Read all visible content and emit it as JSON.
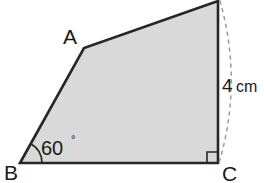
{
  "figure": {
    "kind": "geometry-diagram",
    "shape_name": "quadrilateral",
    "fill_color": "#d9d9d9",
    "stroke_color": "#262626",
    "stroke_width": 2.6,
    "dash_color": "#9a9a9a",
    "background": "#ffffff",
    "canvas": {
      "width": 264,
      "height": 183
    }
  },
  "vertices": {
    "A": {
      "label": "A",
      "x": 84,
      "y": 48,
      "label_x": 70,
      "label_y": 44
    },
    "B": {
      "label": "B",
      "x": 20,
      "y": 163,
      "label_x": 4,
      "label_y": 180
    },
    "C": {
      "label": "C",
      "x": 218,
      "y": 163,
      "label_x": 222,
      "label_y": 181
    },
    "D": {
      "label": "",
      "x": 218,
      "y": 1,
      "label_x": 0,
      "label_y": 0
    }
  },
  "polygon": {
    "points": "20,163 84,48 218,1 218,163",
    "edges": [
      "B-A",
      "A-D",
      "D-C",
      "C-B"
    ]
  },
  "angle_marks": [
    {
      "at_vertex": "B",
      "value": "60",
      "degree_symbol": "°",
      "arc_radius": 22,
      "label_x": 41,
      "label_y": 155,
      "degree_x": 71,
      "degree_y": 143
    }
  ],
  "right_angle_marks": [
    {
      "at_vertex": "C",
      "size": 11,
      "x": 207,
      "y": 152
    }
  ],
  "measurements": [
    {
      "edge": "D-C",
      "value": "4",
      "unit": "cm",
      "value_x": 222,
      "value_y": 92,
      "unit_x": 236,
      "unit_y": 92
    }
  ],
  "arcs": [
    {
      "kind": "dashed-arc",
      "from_vertex": "D",
      "to_vertex": "C",
      "path": "M 220,1 Q 243,82 219,163",
      "dash_pattern": "3 5"
    }
  ]
}
